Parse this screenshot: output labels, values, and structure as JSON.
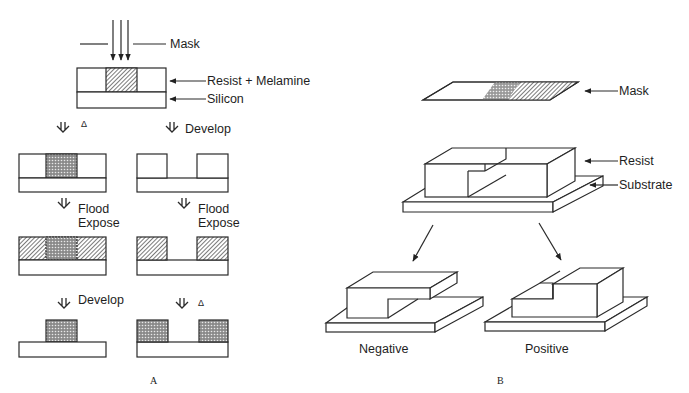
{
  "panel_a": {
    "caption": "A",
    "labels": {
      "mask": "Mask",
      "resist": "Resist + Melamine",
      "silicon": "Silicon"
    },
    "steps": {
      "left_1": "Δ",
      "right_1": "Develop",
      "left_2_line1": "Flood",
      "left_2_line2": "Expose",
      "right_2_line1": "Flood",
      "right_2_line2": "Expose",
      "left_3": "Develop",
      "right_3": "Δ"
    }
  },
  "panel_b": {
    "caption": "B",
    "labels": {
      "mask": "Mask",
      "resist": "Resist",
      "substrate": "Substrate",
      "negative": "Negative",
      "positive": "Positive"
    }
  },
  "colors": {
    "line": "#2a2a2a",
    "background": "#ffffff"
  }
}
